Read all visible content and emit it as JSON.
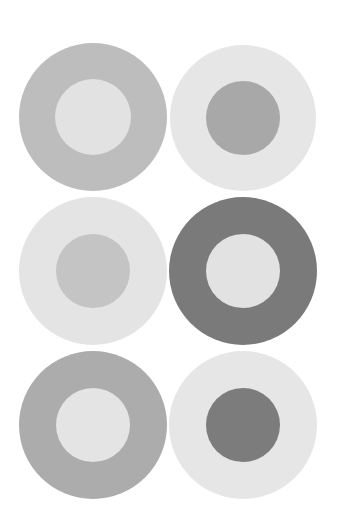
{
  "figure": {
    "rows": 3,
    "columns": 2,
    "circles": [
      {
        "id": "top-left",
        "cx": 93,
        "cy": 117,
        "outer_r": 74,
        "inner_r": 38,
        "outer_color": "#bdbdbd",
        "inner_color": "#e2e2e2"
      },
      {
        "id": "top-right",
        "cx": 243,
        "cy": 118,
        "outer_r": 73,
        "inner_r": 37,
        "outer_color": "#e6e6e6",
        "inner_color": "#a8a8a8"
      },
      {
        "id": "middle-left",
        "cx": 93,
        "cy": 271,
        "outer_r": 74,
        "inner_r": 37,
        "outer_color": "#e4e4e4",
        "inner_color": "#c4c4c4"
      },
      {
        "id": "middle-right",
        "cx": 243,
        "cy": 271,
        "outer_r": 74,
        "inner_r": 37,
        "outer_color": "#7a7a7a",
        "inner_color": "#e2e2e2"
      },
      {
        "id": "bottom-left",
        "cx": 93,
        "cy": 425,
        "outer_r": 74,
        "inner_r": 37,
        "outer_color": "#acacac",
        "inner_color": "#e4e4e4"
      },
      {
        "id": "bottom-right",
        "cx": 243,
        "cy": 425,
        "outer_r": 74,
        "inner_r": 37,
        "outer_color": "#e6e6e6",
        "inner_color": "#7c7c7c"
      }
    ]
  }
}
